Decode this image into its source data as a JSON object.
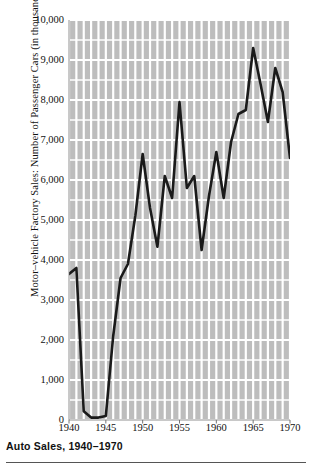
{
  "caption": "Auto Sales, 1940–1970",
  "axis": {
    "y_title": "Motor–vehicle Factory Sales: Number of Passenger Cars (in thousands)",
    "y_ticks": [
      "0",
      "1,000",
      "2,000",
      "3,000",
      "4,000",
      "5,000",
      "6,000",
      "7,000",
      "8,000",
      "9,000",
      "10,000"
    ],
    "x_ticks": [
      "1940",
      "1945",
      "1950",
      "1955",
      "1960",
      "1965",
      "1970"
    ]
  },
  "colors": {
    "line": "#1a1a1a",
    "grid_band": "#bdbdbd",
    "grid_line": "#ffffff",
    "text": "#111111",
    "rule": "#555555"
  },
  "chart_data": {
    "type": "line",
    "title": "Auto Sales, 1940–1970",
    "xlabel": "",
    "ylabel": "Motor–vehicle Factory Sales: Number of Passenger Cars (in thousands)",
    "xlim": [
      1940,
      1970
    ],
    "ylim": [
      0,
      10000
    ],
    "ytick_values": [
      0,
      1000,
      2000,
      3000,
      4000,
      5000,
      6000,
      7000,
      8000,
      9000,
      10000
    ],
    "xtick_values": [
      1940,
      1945,
      1950,
      1955,
      1960,
      1965,
      1970
    ],
    "grid": true,
    "legend": "none",
    "x": [
      1940,
      1941,
      1942,
      1943,
      1944,
      1945,
      1946,
      1947,
      1948,
      1949,
      1950,
      1951,
      1952,
      1953,
      1954,
      1955,
      1956,
      1957,
      1958,
      1959,
      1960,
      1961,
      1962,
      1963,
      1964,
      1965,
      1966,
      1967,
      1968,
      1969,
      1970
    ],
    "values": [
      3650,
      3800,
      220,
      60,
      60,
      100,
      2100,
      3550,
      3900,
      5100,
      6650,
      5300,
      4330,
      6100,
      5550,
      7950,
      5800,
      6100,
      4250,
      5600,
      6700,
      5550,
      6950,
      7650,
      7750,
      9300,
      8400,
      7450,
      8800,
      8200,
      6550
    ],
    "annotations": []
  }
}
